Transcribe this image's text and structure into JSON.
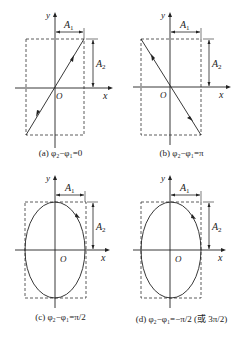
{
  "panels": [
    {
      "id": "a",
      "type": "line",
      "direction": "positive-slope",
      "caption": "(a) φ₂−φ₁=0"
    },
    {
      "id": "b",
      "type": "line",
      "direction": "negative-slope",
      "caption": "(b) φ₂−φ₁=π"
    },
    {
      "id": "c",
      "type": "ellipse",
      "direction": "clockwise",
      "caption": "(c) φ₂−φ₁=π/2"
    },
    {
      "id": "d",
      "type": "ellipse",
      "direction": "clockwise",
      "caption": "(d) φ₂−φ₁=−π/2 (或 3π/2)"
    }
  ],
  "labels": {
    "x_axis": "x",
    "y_axis": "y",
    "origin": "O",
    "amp1": "A",
    "amp1_sub": "1",
    "amp2": "A",
    "amp2_sub": "2"
  },
  "colors": {
    "stroke": "#222222",
    "dash": "#333333"
  }
}
